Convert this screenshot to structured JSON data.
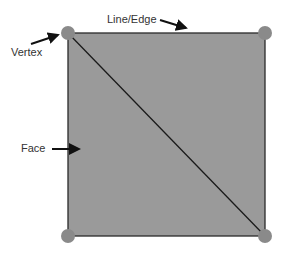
{
  "labels": {
    "vertex": "Vertex",
    "edge": "Line/Edge",
    "face": "Face"
  },
  "colors": {
    "face": "#9a9a9a",
    "edge": "#2a2a2a",
    "vertex": "#8a8a8a",
    "label": "#333333"
  }
}
